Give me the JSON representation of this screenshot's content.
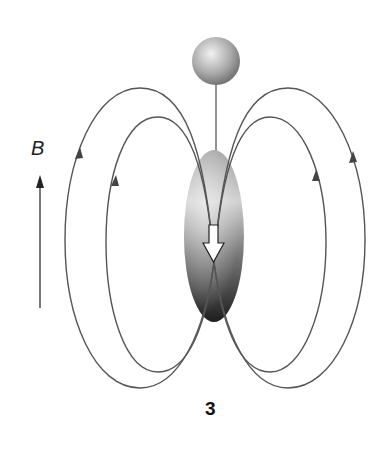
{
  "figure": {
    "field_label": "B",
    "caption": "3",
    "elements": {
      "sphere": "gray sphere suspended on a stem",
      "body": "shaded elongated ellipsoid",
      "moment_arrow": "white hollow arrow pointing down",
      "field_lines": "two pairs of closed loops on each side with direction arrows pointing up on outer sides"
    },
    "colors": {
      "line": "#555555",
      "background": "#ffffff"
    }
  }
}
